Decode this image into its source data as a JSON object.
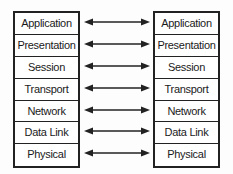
{
  "diagram": {
    "title": "",
    "left_stack": [
      "Application",
      "Presentation",
      "Session",
      "Transport",
      "Network",
      "Data Link",
      "Physical"
    ],
    "right_stack": [
      "Application",
      "Presentation",
      "Session",
      "Transport",
      "Network",
      "Data Link",
      "Physical"
    ],
    "connections": [
      {
        "from": "Application",
        "to": "Application",
        "type": "bidirectional-arrow"
      },
      {
        "from": "Presentation",
        "to": "Presentation",
        "type": "bidirectional-arrow"
      },
      {
        "from": "Session",
        "to": "Session",
        "type": "bidirectional-arrow"
      },
      {
        "from": "Transport",
        "to": "Transport",
        "type": "bidirectional-arrow"
      },
      {
        "from": "Network",
        "to": "Network",
        "type": "bidirectional-arrow"
      },
      {
        "from": "Data Link",
        "to": "Data Link",
        "type": "bidirectional-arrow"
      },
      {
        "from": "Physical",
        "to": "Physical",
        "type": "bidirectional-arrow"
      }
    ],
    "colors": {
      "line": "#222222",
      "box_fill": "#ffffff",
      "background": "#fdfdfd"
    }
  }
}
